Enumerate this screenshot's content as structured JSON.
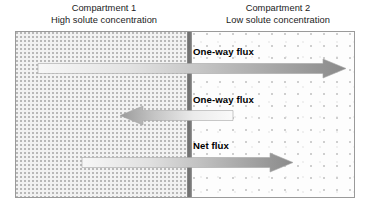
{
  "diagram": {
    "title_visible": false,
    "compartments": [
      {
        "id": "left",
        "name": "Compartment 1",
        "concentration_label": "High solute concentration",
        "stipple": "dense"
      },
      {
        "id": "right",
        "name": "Compartment 2",
        "concentration_label": "Low solute concentration",
        "stipple": "sparse"
      }
    ],
    "membrane": {
      "name": "membrane",
      "color": "#6d6d6d"
    },
    "fluxes": [
      {
        "id": "one-way-right",
        "label": "One-way flux",
        "direction": "right",
        "magnitude": "large"
      },
      {
        "id": "one-way-left",
        "label": "One-way flux",
        "direction": "left",
        "magnitude": "small"
      },
      {
        "id": "net",
        "label": "Net flux",
        "direction": "right",
        "magnitude": "medium"
      }
    ],
    "colors": {
      "arrow_light": "#f4f4f4",
      "arrow_dark": "#8c8c8c",
      "border": "#9a9a9a",
      "text": "#1b1b1b"
    }
  }
}
